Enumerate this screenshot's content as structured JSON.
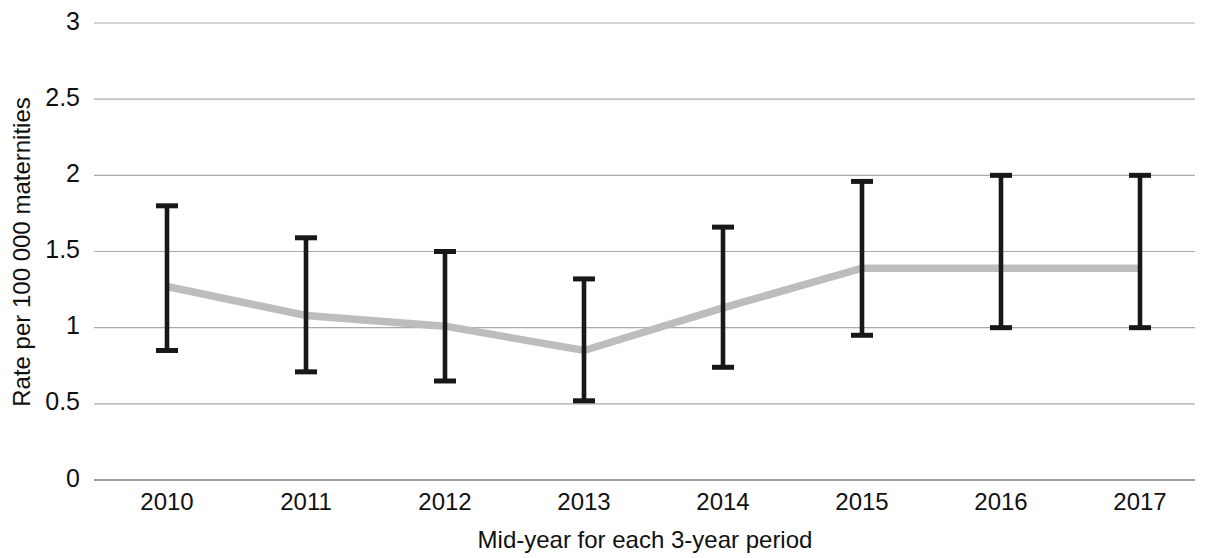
{
  "chart_data": {
    "type": "line",
    "title": "",
    "subtitle": "",
    "xlabel": "Mid-year for each 3-year period",
    "ylabel": "Rate per 100 000 maternities",
    "categories": [
      "2010",
      "2011",
      "2012",
      "2013",
      "2014",
      "2015",
      "2016",
      "2017"
    ],
    "values": [
      1.27,
      1.08,
      1.01,
      0.85,
      1.13,
      1.39,
      1.39,
      1.39
    ],
    "error_bars": {
      "lower": [
        0.85,
        0.71,
        0.65,
        0.52,
        0.74,
        0.95,
        1.0,
        1.0
      ],
      "upper": [
        1.8,
        1.59,
        1.5,
        1.32,
        1.66,
        1.96,
        2.0,
        2.0
      ]
    },
    "series": [
      {
        "name": "Rate per 100 000 maternities",
        "values": [
          1.27,
          1.08,
          1.01,
          0.85,
          1.13,
          1.39,
          1.39,
          1.39
        ],
        "color": "#bdbdbd"
      }
    ],
    "ylim": [
      0,
      3
    ],
    "yticks": [
      "0",
      "0.5",
      "1",
      "1.5",
      "2",
      "2.5",
      "3"
    ],
    "ytick_values": [
      0,
      0.5,
      1,
      1.5,
      2,
      2.5,
      3
    ],
    "xlim_categories": [
      "2010",
      "2017"
    ],
    "grid": "horizontal",
    "legend": "none",
    "legend_position": "none",
    "colors": {
      "line": "#bdbdbd",
      "error_bar": "#181818",
      "gridline": "#a9a9a9",
      "axis": "#8c8c8c",
      "text": "#111111",
      "background": "#ffffff"
    }
  }
}
